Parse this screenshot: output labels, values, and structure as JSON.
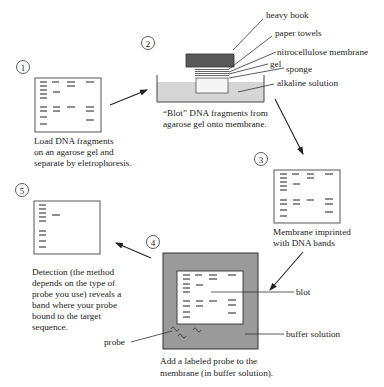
{
  "steps": [
    {
      "number": "1",
      "caption": [
        "Load DNA fragments",
        "on an agarose gel and",
        "separate by eletrophoresis."
      ]
    },
    {
      "number": "2",
      "caption": [
        "“Blot” DNA fragments from",
        "agarose gel onto membrane."
      ]
    },
    {
      "number": "3",
      "caption": [
        "Membrane imprinted",
        "with DNA bands"
      ]
    },
    {
      "number": "4",
      "caption": [
        "Add a labeled probe to the",
        "membrane (in buffer solution)."
      ]
    },
    {
      "number": "5",
      "caption": [
        "Detection (the method",
        "depends on the type of",
        "probe you use) reveals a",
        "band where your probe",
        "bound to the target",
        "sequence."
      ]
    }
  ],
  "blot_apparatus_labels": {
    "heavy_book": "heavy book",
    "paper_towels": "paper towels",
    "membrane": "nitrocellulose membrane",
    "gel": "gel",
    "sponge": "sponge",
    "solution": "alkaline solution"
  },
  "hybridization_labels": {
    "blot": "blot",
    "buffer": "buffer solution",
    "probe": "probe"
  },
  "colors": {
    "book": "#595959",
    "alkaline_solution": "#d6d6d6",
    "buffer_solution": "#9a9a9a",
    "line": "#333333"
  }
}
